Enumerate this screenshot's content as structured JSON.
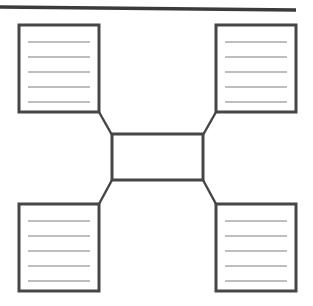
{
  "document": {
    "title": "Blank graphic organizer worksheet",
    "description": "Four-corner concept web: a central empty box linked by diagonal connectors to four ruled note boxes",
    "background_color": "#ffffff"
  },
  "styles": {
    "border_color": "#464646",
    "rule_line_color": "#a8a8a8",
    "connector_color": "#464646",
    "top_rule_color": "#3b3b3b",
    "box_fill": "#ffffff",
    "border_width": 3,
    "rule_line_width": 1.4,
    "connector_width": 2.4,
    "top_rule_width": 3.4
  },
  "top_rule": {
    "name": "top-divider-rule",
    "x1": 0,
    "y1": 7,
    "x2": 296,
    "y2": 10
  },
  "center_box": {
    "name": "center-topic-box",
    "label": "",
    "x": 112,
    "y": 134,
    "width": 91,
    "height": 46,
    "writing_lines": 0
  },
  "boxes": [
    {
      "id": "top-left",
      "name": "note-box-top-left",
      "label": "",
      "x": 19,
      "y": 25,
      "width": 80,
      "height": 87,
      "writing_lines": 5
    },
    {
      "id": "top-right",
      "name": "note-box-top-right",
      "label": "",
      "x": 216,
      "y": 25,
      "width": 80,
      "height": 87,
      "writing_lines": 5
    },
    {
      "id": "bottom-left",
      "name": "note-box-bottom-left",
      "label": "",
      "x": 19,
      "y": 204,
      "width": 80,
      "height": 87,
      "writing_lines": 5
    },
    {
      "id": "bottom-right",
      "name": "note-box-bottom-right",
      "label": "",
      "x": 216,
      "y": 204,
      "width": 80,
      "height": 87,
      "writing_lines": 5
    }
  ],
  "connectors": [
    {
      "id": "connector-top-left",
      "name": "connector-center-to-top-left",
      "x1": 99,
      "y1": 112,
      "x2": 112,
      "y2": 135
    },
    {
      "id": "connector-top-right",
      "name": "connector-center-to-top-right",
      "x1": 216,
      "y1": 112,
      "x2": 203,
      "y2": 135
    },
    {
      "id": "connector-bottom-left",
      "name": "connector-center-to-bottom-left",
      "x1": 99,
      "y1": 204,
      "x2": 112,
      "y2": 180
    },
    {
      "id": "connector-bottom-right",
      "name": "connector-center-to-bottom-right",
      "x1": 216,
      "y1": 204,
      "x2": 203,
      "y2": 180
    }
  ],
  "rule_geometry": {
    "inset_x": 9,
    "first_line_offset": 17,
    "line_gap": 15
  }
}
